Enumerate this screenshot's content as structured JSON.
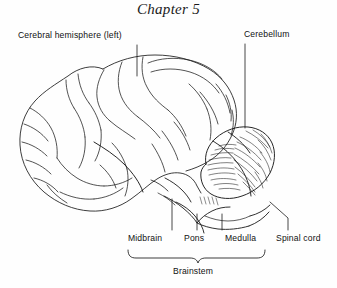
{
  "figure": {
    "title": "Chapter 5",
    "ink_color": "#1a1a1a",
    "background_color": "#fefefe"
  },
  "labels": {
    "cerebral_hemisphere": "Cerebral hemisphere (left)",
    "cerebellum": "Cerebellum",
    "midbrain": "Midbrain",
    "pons": "Pons",
    "medulla": "Medulla",
    "spinal_cord": "Spinal cord",
    "brainstem": "Brainstem"
  }
}
